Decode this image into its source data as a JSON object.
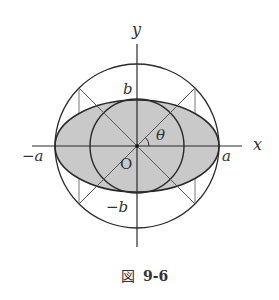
{
  "figure": {
    "caption_prefix": "図",
    "caption_number": "9-6"
  },
  "labels": {
    "x_axis": "x",
    "y_axis": "y",
    "pos_a": "a",
    "neg_a": "−a",
    "pos_b": "b",
    "neg_b": "−b",
    "origin": "O",
    "angle": "θ"
  },
  "geometry": {
    "center": [
      137,
      146
    ],
    "outer_circle_radius": 79,
    "inner_circle_radius": 47,
    "ellipse_rx": 82,
    "ellipse_ry": 46,
    "diagonal_angle_deg": 45
  },
  "colors": {
    "stroke": "#2a2a2a",
    "ellipse_fill": "#c8c8c8",
    "thin_stroke": "#777777"
  }
}
